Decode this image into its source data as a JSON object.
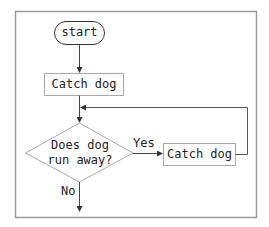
{
  "diagram": {
    "type": "flowchart",
    "nodes": {
      "start": {
        "label": "start",
        "shape": "terminal"
      },
      "catch1": {
        "label": "Catch dog",
        "shape": "process"
      },
      "decision": {
        "line1": "Does dog",
        "line2": "run away?",
        "shape": "decision"
      },
      "catch2": {
        "label": "Catch dog",
        "shape": "process"
      }
    },
    "edges": {
      "yes_label": "Yes",
      "no_label": "No"
    },
    "colors": {
      "frame": "#9a9a9a",
      "shape_border": "#a8a8a8",
      "line": "#555555",
      "text": "#222222"
    }
  }
}
